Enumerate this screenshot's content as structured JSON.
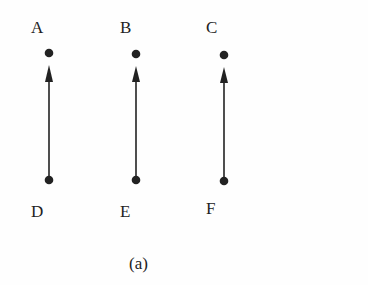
{
  "diagram": {
    "caption": "(a)",
    "nodes": [
      {
        "id": "A",
        "label": "A",
        "x": 49,
        "y": 53
      },
      {
        "id": "B",
        "label": "B",
        "x": 136,
        "y": 54
      },
      {
        "id": "C",
        "label": "C",
        "x": 224,
        "y": 55
      },
      {
        "id": "D",
        "label": "D",
        "x": 49,
        "y": 180
      },
      {
        "id": "E",
        "label": "E",
        "x": 136,
        "y": 180
      },
      {
        "id": "F",
        "label": "F",
        "x": 224,
        "y": 181
      }
    ],
    "edges": [
      {
        "from": "D",
        "to": "A",
        "directed": true
      },
      {
        "from": "E",
        "to": "B",
        "directed": true
      },
      {
        "from": "F",
        "to": "C",
        "directed": true
      }
    ],
    "colors": {
      "ink": "#222222",
      "background": "#fefefe"
    }
  }
}
